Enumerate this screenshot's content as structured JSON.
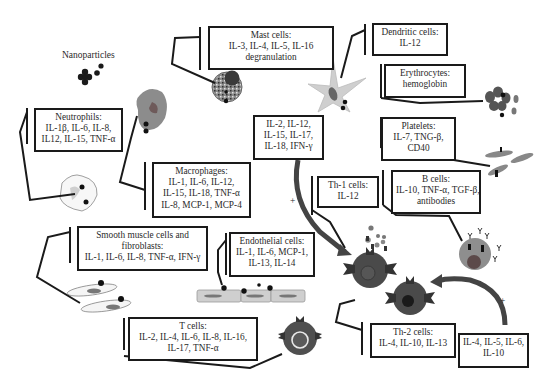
{
  "title_label": "Nanoparticles",
  "colors": {
    "line": "#1a1a1a",
    "cell_dark": "#555555",
    "cell_medium": "#888888",
    "cell_light": "#c8c8c8",
    "particle": "#1a1a1a",
    "background": "#ffffff"
  },
  "boxes": {
    "mast_cells": {
      "title": "Mast cells:",
      "lines": [
        "IL-3, IL-4, IL-5, IL-16",
        "degranulation"
      ]
    },
    "dendritic_cells": {
      "title": "Dendritic cells:",
      "lines": [
        "IL-12"
      ]
    },
    "erythrocytes": {
      "title": "Erythrocytes:",
      "lines": [
        "hemoglobin"
      ]
    },
    "neutrophils": {
      "title": "Neutrophils:",
      "lines": [
        "IL-1β, IL-6, IL-8,",
        "IL12, IL-15, TNF-α"
      ]
    },
    "platelets": {
      "title": "Platelets:",
      "lines": [
        "IL-7, TNG-β,",
        "CD40"
      ]
    },
    "cytokines_th1": {
      "title": "",
      "lines": [
        "IL-2, IL-12,",
        "IL-15, IL-17,",
        "IL-18, IFN-γ"
      ]
    },
    "th1_cells": {
      "title": "Th-1 cells:",
      "lines": [
        "IL-12"
      ]
    },
    "b_cells": {
      "title": "B cells:",
      "lines": [
        "IL-10, TNF-α, TGF-β,",
        "antibodies"
      ]
    },
    "macrophages": {
      "title": "Macrophages:",
      "lines": [
        "IL-1, IL-6, IL-12,",
        "IL-15, IL-18, TNF-α",
        "IL-8, MCP-1, MCP-4"
      ]
    },
    "smooth_muscle": {
      "title": "Smooth muscle cells and",
      "lines": [
        "fibroblasts:",
        "IL-1, IL-6, IL-8, TNF-α, IFN-γ"
      ]
    },
    "endothelial_cells": {
      "title": "Endothelial cells:",
      "lines": [
        "IL-1, IL-6, MCP-1,",
        "IL-13, IL-14"
      ]
    },
    "t_cells": {
      "title": "T cells:",
      "lines": [
        "IL-2, IL-4, IL-6, IL-8, IL-16,",
        "IL-17, TNF-α"
      ]
    },
    "th2_cells": {
      "title": "Th-2 cells:",
      "lines": [
        "IL-4, IL-10, IL-13"
      ]
    },
    "cytokines_th2": {
      "title": "",
      "lines": [
        "IL-4, IL-5, IL-6,",
        "IL-10"
      ]
    }
  },
  "signs": {
    "plus_left": "+",
    "plus_right": "+"
  }
}
